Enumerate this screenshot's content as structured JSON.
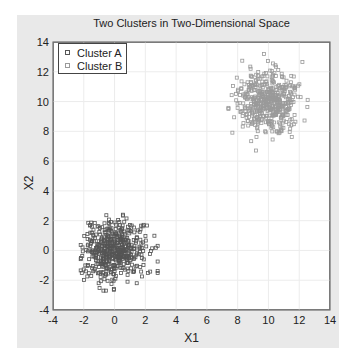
{
  "chart_data": {
    "type": "scatter",
    "title": "Two Clusters in Two-Dimensional Space",
    "xlabel": "X1",
    "ylabel": "X2",
    "xlim": [
      -4,
      14
    ],
    "ylim": [
      -4,
      14
    ],
    "xticks": [
      -4,
      -2,
      0,
      2,
      4,
      6,
      8,
      10,
      12,
      14
    ],
    "yticks": [
      -4,
      -2,
      0,
      2,
      4,
      6,
      8,
      10,
      12,
      14
    ],
    "grid": true,
    "legend_position": "upper left",
    "series": [
      {
        "name": "Cluster A",
        "marker": "square",
        "color": "#555555",
        "center": [
          0,
          0
        ],
        "std": 1.0,
        "n": 500,
        "x_range": [
          -2.2,
          2.8
        ],
        "y_range": [
          -2.7,
          2.4
        ],
        "seed": 7
      },
      {
        "name": "Cluster B",
        "marker": "square",
        "color": "#9a9a9a",
        "center": [
          10,
          10
        ],
        "std": 1.0,
        "n": 500,
        "x_range": [
          7.4,
          12.8
        ],
        "y_range": [
          6.1,
          13.2
        ],
        "seed": 13
      }
    ]
  },
  "legend": {
    "items": [
      "Cluster A",
      "Cluster B"
    ]
  }
}
